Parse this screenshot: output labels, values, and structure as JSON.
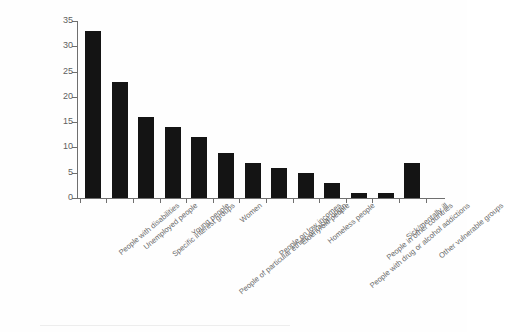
{
  "chart_data": {
    "type": "bar",
    "title": "",
    "subtitle": "",
    "xlabel": "",
    "ylabel": "",
    "ylim": [
      0,
      35
    ],
    "yticks": [
      0,
      5,
      10,
      15,
      20,
      25,
      30,
      35
    ],
    "grid": false,
    "legend": null,
    "orientation": "vertical",
    "bar_color": "#141414",
    "axis_color": "#6f6f6f",
    "label_color": "#6b6b6b",
    "categories": [
      "People with disabilities",
      "Unemployed people",
      "Specific interest groups",
      "Young people",
      "People of particular ethnic or racial origin",
      "Women",
      "People on low incomes",
      "Elderly/old people",
      "Homeless people",
      "People with drug or alcohol addictions",
      "People in other countries",
      "Sick/mentally ill",
      "Other vulnerable groups"
    ],
    "values": [
      33,
      23,
      16,
      14,
      12,
      9,
      7,
      6,
      5,
      3,
      1,
      1,
      7
    ]
  }
}
